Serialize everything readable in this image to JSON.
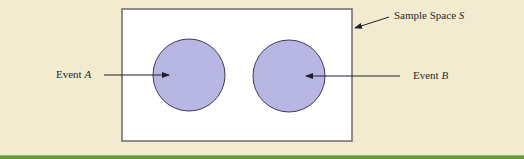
{
  "diagram": {
    "type": "venn-mutually-exclusive",
    "sample_space": {
      "label": "Sample Space",
      "symbol": "S"
    },
    "events": [
      {
        "label": "Event",
        "symbol": "A"
      },
      {
        "label": "Event",
        "symbol": "B"
      }
    ]
  },
  "colors": {
    "background": "#f3ebcf",
    "sample_space_fill": "#ffffff",
    "sample_space_border": "#6b6b6b",
    "event_fill": "#b8b6e2",
    "event_border": "#3e3a5a",
    "arrow": "#1e1e2e",
    "bottom_bar": "#6a9a3a"
  }
}
